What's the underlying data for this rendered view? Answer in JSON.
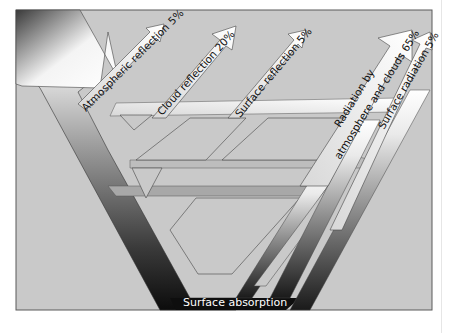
{
  "diagram": {
    "colors": {
      "background": "#c9c9c9",
      "frame": "#5a5a5a",
      "flow_dark": "#111111",
      "flow_mid": "#8a8a8a",
      "flow_light": "#f2f2f2"
    },
    "labels": {
      "atmospheric_reflection": "Atmospheric reflection 5%",
      "cloud_reflection": "Cloud reflection 20%",
      "surface_reflection": "Surface reflection 5%",
      "radiation_line1": "Radiation by",
      "radiation_line2": "atmosphere and clouds 65%",
      "surface_radiation": "Surface radiation 5%",
      "surface_absorption": "Surface absorption"
    },
    "flows": [
      {
        "name": "Incoming solar radiation",
        "value": 100
      },
      {
        "name": "Atmospheric reflection",
        "value": 5
      },
      {
        "name": "Cloud reflection",
        "value": 20
      },
      {
        "name": "Surface reflection",
        "value": 5
      },
      {
        "name": "Radiation by atmosphere and clouds",
        "value": 65
      },
      {
        "name": "Surface radiation",
        "value": 5
      },
      {
        "name": "Surface absorption",
        "value": null
      }
    ]
  }
}
